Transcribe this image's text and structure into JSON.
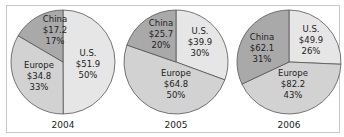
{
  "chart_data": [
    {
      "type": "pie",
      "title": "2004",
      "slices": [
        {
          "label": "U.S.",
          "value": 51.9,
          "value_text": "$51.9",
          "percent": 50,
          "percent_text": "50%",
          "color": "#e6e6e6"
        },
        {
          "label": "Europe",
          "value": 34.8,
          "value_text": "$34.8",
          "percent": 33,
          "percent_text": "33%",
          "color": "#d2d2d2"
        },
        {
          "label": "China",
          "value": 17.2,
          "value_text": "$17.2",
          "percent": 17,
          "percent_text": "17%",
          "color": "#a9a9a9"
        }
      ]
    },
    {
      "type": "pie",
      "title": "2005",
      "slices": [
        {
          "label": "U.S.",
          "value": 39.9,
          "value_text": "$39.9",
          "percent": 30,
          "percent_text": "30%",
          "color": "#e6e6e6"
        },
        {
          "label": "Europe",
          "value": 64.8,
          "value_text": "$64.8",
          "percent": 50,
          "percent_text": "50%",
          "color": "#d2d2d2"
        },
        {
          "label": "China",
          "value": 25.7,
          "value_text": "$25.7",
          "percent": 20,
          "percent_text": "20%",
          "color": "#a9a9a9"
        }
      ]
    },
    {
      "type": "pie",
      "title": "2006",
      "slices": [
        {
          "label": "U.S.",
          "value": 49.9,
          "value_text": "$49.9",
          "percent": 26,
          "percent_text": "26%",
          "color": "#e6e6e6"
        },
        {
          "label": "Europe",
          "value": 82.2,
          "value_text": "$82.2",
          "percent": 43,
          "percent_text": "43%",
          "color": "#d2d2d2"
        },
        {
          "label": "China",
          "value": 62.1,
          "value_text": "$62.1",
          "percent": 31,
          "percent_text": "31%",
          "color": "#a9a9a9"
        }
      ]
    }
  ]
}
